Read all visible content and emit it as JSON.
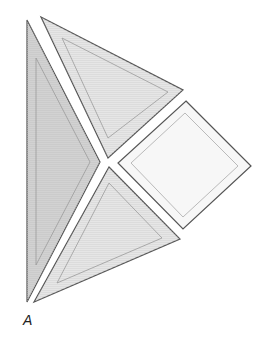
{
  "figure": {
    "label": "A",
    "colors": {
      "outline": "#555555",
      "inner_outline": "#9a9a9a",
      "dark_fill": "#d2d2d2",
      "light_fill": "#e6e6e6",
      "square_fill": "#f7f7f7",
      "hatch": "#c4c4c4"
    },
    "shapes": [
      {
        "name": "left-triangle",
        "points": "27,20 100,162 27,302",
        "inner": "36,58 90,162 36,265",
        "fill": "dark"
      },
      {
        "name": "top-triangle",
        "points": "41,17 183,90 108,158",
        "inner": "62,38 168,92 108,138",
        "fill": "light"
      },
      {
        "name": "bottom-triangle",
        "points": "109,167 180,239 34,302",
        "inner": "109,183 162,238 57,283",
        "fill": "light"
      },
      {
        "name": "square",
        "points": "186,101 251,166 183,229 118,163",
        "inner": "185,113 238,166 183,217 131,163",
        "fill": "square"
      }
    ]
  }
}
